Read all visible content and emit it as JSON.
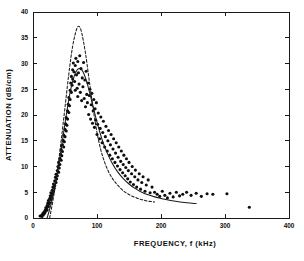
{
  "chart_data": {
    "type": "scatter",
    "title": "",
    "xlabel": "FREQUENCY, f (kHz)",
    "ylabel": "ATTENUATION (dB/cm)",
    "xlim": [
      0,
      400
    ],
    "ylim": [
      0,
      40
    ],
    "xticks": [
      0,
      100,
      200,
      300,
      400
    ],
    "yticks": [
      0,
      5,
      10,
      15,
      20,
      25,
      30,
      35,
      40
    ],
    "xticklabels": [
      "0",
      "100",
      "200",
      "300",
      "400"
    ],
    "yticklabels": [
      "0",
      "5",
      "10",
      "15",
      "20",
      "25",
      "30",
      "35",
      "40"
    ],
    "grid": false,
    "legend": null,
    "frame": "box",
    "tick_direction": "in",
    "series": [
      {
        "name": "measured data",
        "type": "scatter",
        "marker": "filled-circle",
        "points": [
          [
            11,
            0.4
          ],
          [
            13,
            0.5
          ],
          [
            14,
            0.3
          ],
          [
            15,
            0.8
          ],
          [
            16,
            0.6
          ],
          [
            17,
            1.1
          ],
          [
            18,
            0.9
          ],
          [
            19,
            1.5
          ],
          [
            20,
            1.3
          ],
          [
            20,
            2.0
          ],
          [
            21,
            1.8
          ],
          [
            22,
            2.4
          ],
          [
            22,
            1.6
          ],
          [
            23,
            2.9
          ],
          [
            24,
            2.2
          ],
          [
            24,
            3.4
          ],
          [
            25,
            2.7
          ],
          [
            26,
            3.8
          ],
          [
            26,
            3.0
          ],
          [
            27,
            4.3
          ],
          [
            28,
            3.6
          ],
          [
            28,
            4.9
          ],
          [
            29,
            4.1
          ],
          [
            30,
            5.4
          ],
          [
            30,
            4.6
          ],
          [
            31,
            6.0
          ],
          [
            32,
            5.1
          ],
          [
            32,
            6.6
          ],
          [
            33,
            5.8
          ],
          [
            34,
            7.2
          ],
          [
            34,
            6.3
          ],
          [
            35,
            7.9
          ],
          [
            36,
            6.9
          ],
          [
            36,
            8.5
          ],
          [
            37,
            7.6
          ],
          [
            38,
            9.2
          ],
          [
            38,
            8.2
          ],
          [
            39,
            10.0
          ],
          [
            40,
            8.9
          ],
          [
            40,
            10.8
          ],
          [
            41,
            9.7
          ],
          [
            42,
            11.6
          ],
          [
            42,
            10.4
          ],
          [
            43,
            12.4
          ],
          [
            44,
            11.2
          ],
          [
            44,
            13.3
          ],
          [
            45,
            12.1
          ],
          [
            46,
            14.2
          ],
          [
            46,
            12.9
          ],
          [
            47,
            15.1
          ],
          [
            48,
            13.8
          ],
          [
            48,
            16.1
          ],
          [
            49,
            14.8
          ],
          [
            50,
            17.2
          ],
          [
            50,
            15.8
          ],
          [
            51,
            18.3
          ],
          [
            52,
            16.9
          ],
          [
            52,
            19.5
          ],
          [
            53,
            18.0
          ],
          [
            54,
            20.8
          ],
          [
            54,
            19.2
          ],
          [
            55,
            22.1
          ],
          [
            56,
            20.5
          ],
          [
            56,
            23.4
          ],
          [
            57,
            21.8
          ],
          [
            58,
            24.8
          ],
          [
            58,
            23.0
          ],
          [
            59,
            26.2
          ],
          [
            60,
            24.4
          ],
          [
            60,
            27.5
          ],
          [
            61,
            25.8
          ],
          [
            62,
            28.8
          ],
          [
            62,
            27.0
          ],
          [
            63,
            30.1
          ],
          [
            64,
            28.4
          ],
          [
            65,
            26.5
          ],
          [
            66,
            29.6
          ],
          [
            66,
            24.8
          ],
          [
            67,
            31.0
          ],
          [
            68,
            27.8
          ],
          [
            69,
            25.2
          ],
          [
            70,
            30.4
          ],
          [
            70,
            23.6
          ],
          [
            71,
            28.2
          ],
          [
            72,
            26.0
          ],
          [
            73,
            31.5
          ],
          [
            74,
            24.4
          ],
          [
            75,
            29.0
          ],
          [
            76,
            22.8
          ],
          [
            77,
            27.2
          ],
          [
            78,
            25.5
          ],
          [
            79,
            30.2
          ],
          [
            80,
            23.2
          ],
          [
            81,
            26.8
          ],
          [
            82,
            21.6
          ],
          [
            83,
            28.5
          ],
          [
            84,
            24.0
          ],
          [
            85,
            22.4
          ],
          [
            86,
            26.2
          ],
          [
            87,
            20.1
          ],
          [
            88,
            23.8
          ],
          [
            89,
            25.0
          ],
          [
            90,
            19.2
          ],
          [
            91,
            22.0
          ],
          [
            92,
            24.2
          ],
          [
            93,
            18.4
          ],
          [
            94,
            20.8
          ],
          [
            95,
            23.0
          ],
          [
            96,
            17.6
          ],
          [
            97,
            21.2
          ],
          [
            98,
            19.0
          ],
          [
            99,
            22.4
          ],
          [
            100,
            16.2
          ],
          [
            101,
            18.2
          ],
          [
            102,
            20.4
          ],
          [
            104,
            15.4
          ],
          [
            105,
            17.4
          ],
          [
            106,
            19.6
          ],
          [
            108,
            14.6
          ],
          [
            109,
            16.6
          ],
          [
            110,
            18.8
          ],
          [
            112,
            13.8
          ],
          [
            113,
            15.8
          ],
          [
            114,
            17.8
          ],
          [
            116,
            13.0
          ],
          [
            117,
            15.0
          ],
          [
            118,
            17.0
          ],
          [
            120,
            12.2
          ],
          [
            121,
            14.2
          ],
          [
            122,
            16.2
          ],
          [
            124,
            11.5
          ],
          [
            125,
            13.4
          ],
          [
            126,
            15.4
          ],
          [
            128,
            10.8
          ],
          [
            129,
            12.6
          ],
          [
            130,
            14.6
          ],
          [
            132,
            10.1
          ],
          [
            133,
            11.8
          ],
          [
            134,
            13.8
          ],
          [
            136,
            9.4
          ],
          [
            137,
            11.0
          ],
          [
            138,
            13.0
          ],
          [
            140,
            8.8
          ],
          [
            141,
            10.4
          ],
          [
            142,
            12.2
          ],
          [
            144,
            8.2
          ],
          [
            145,
            9.8
          ],
          [
            146,
            11.5
          ],
          [
            148,
            7.6
          ],
          [
            149,
            9.2
          ],
          [
            150,
            10.8
          ],
          [
            152,
            7.0
          ],
          [
            154,
            8.6
          ],
          [
            155,
            10.0
          ],
          [
            157,
            6.5
          ],
          [
            159,
            8.0
          ],
          [
            160,
            9.3
          ],
          [
            162,
            6.0
          ],
          [
            164,
            7.4
          ],
          [
            166,
            8.6
          ],
          [
            168,
            5.6
          ],
          [
            170,
            6.9
          ],
          [
            172,
            8.0
          ],
          [
            175,
            5.2
          ],
          [
            177,
            6.4
          ],
          [
            180,
            7.4
          ],
          [
            183,
            4.9
          ],
          [
            186,
            6.0
          ],
          [
            190,
            5.0
          ],
          [
            194,
            4.6
          ],
          [
            198,
            4.2
          ],
          [
            202,
            5.2
          ],
          [
            206,
            4.4
          ],
          [
            210,
            3.9
          ],
          [
            214,
            4.8
          ],
          [
            219,
            4.1
          ],
          [
            224,
            5.0
          ],
          [
            229,
            4.3
          ],
          [
            234,
            4.6
          ],
          [
            240,
            5.0
          ],
          [
            247,
            4.4
          ],
          [
            255,
            4.8
          ],
          [
            263,
            4.2
          ],
          [
            272,
            4.7
          ],
          [
            281,
            4.6
          ],
          [
            303,
            4.7
          ],
          [
            338,
            2.1
          ]
        ]
      },
      {
        "name": "theoretical curve (broad)",
        "type": "line",
        "style": "solid",
        "points": [
          [
            22,
            0.0
          ],
          [
            28,
            2.6
          ],
          [
            34,
            6.0
          ],
          [
            40,
            10.2
          ],
          [
            46,
            15.0
          ],
          [
            52,
            20.0
          ],
          [
            58,
            24.4
          ],
          [
            64,
            27.4
          ],
          [
            70,
            28.9
          ],
          [
            76,
            28.8
          ],
          [
            82,
            27.2
          ],
          [
            88,
            24.6
          ],
          [
            94,
            21.6
          ],
          [
            100,
            18.6
          ],
          [
            108,
            15.2
          ],
          [
            116,
            12.6
          ],
          [
            124,
            10.6
          ],
          [
            132,
            9.0
          ],
          [
            140,
            7.8
          ],
          [
            150,
            6.6
          ],
          [
            160,
            5.7
          ],
          [
            170,
            5.0
          ],
          [
            180,
            4.5
          ],
          [
            190,
            4.1
          ],
          [
            200,
            3.8
          ],
          [
            215,
            3.4
          ],
          [
            230,
            3.1
          ],
          [
            245,
            2.9
          ],
          [
            255,
            2.8
          ]
        ]
      },
      {
        "name": "theoretical curve (narrow)",
        "type": "line",
        "style": "dashed",
        "points": [
          [
            26,
            0.0
          ],
          [
            32,
            4.0
          ],
          [
            38,
            9.0
          ],
          [
            44,
            15.0
          ],
          [
            50,
            21.5
          ],
          [
            56,
            28.0
          ],
          [
            62,
            33.4
          ],
          [
            68,
            36.6
          ],
          [
            72,
            37.2
          ],
          [
            76,
            36.0
          ],
          [
            82,
            32.0
          ],
          [
            88,
            26.6
          ],
          [
            94,
            21.2
          ],
          [
            100,
            16.6
          ],
          [
            106,
            13.2
          ],
          [
            112,
            10.8
          ],
          [
            118,
            9.0
          ],
          [
            124,
            7.7
          ],
          [
            130,
            6.7
          ],
          [
            136,
            5.9
          ],
          [
            142,
            5.2
          ],
          [
            148,
            4.7
          ],
          [
            154,
            4.3
          ],
          [
            160,
            4.0
          ],
          [
            166,
            3.7
          ],
          [
            172,
            3.5
          ],
          [
            178,
            3.3
          ],
          [
            184,
            3.2
          ],
          [
            190,
            3.1
          ]
        ]
      }
    ]
  }
}
